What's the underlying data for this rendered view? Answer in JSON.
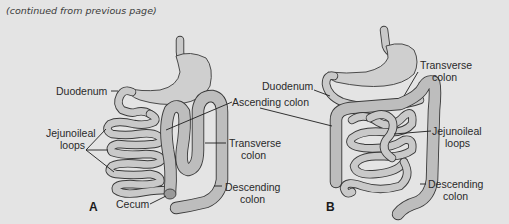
{
  "header": {
    "continuation_note": "(continued from previous page)"
  },
  "figure": {
    "panels": [
      {
        "id": "A",
        "label": "A",
        "labels": {
          "duodenum": "Duodenum",
          "jejunoileal_line1": "Jejunoileal",
          "jejunoileal_line2": "loops",
          "cecum": "Cecum",
          "ascending_colon": "Ascending colon",
          "transverse_line1": "Transverse",
          "transverse_line2": "colon",
          "descending_line1": "Descending",
          "descending_line2": "colon"
        }
      },
      {
        "id": "B",
        "label": "B",
        "labels": {
          "duodenum": "Duodenum",
          "transverse_line1": "Transverse",
          "transverse_line2": "colon",
          "jejunoileal_line1": "Jejunoileal",
          "jejunoileal_line2": "loops",
          "descending_line1": "Descending",
          "descending_line2": "colon"
        }
      }
    ]
  },
  "colors": {
    "background": "#e4e4e4",
    "organ_fill": "#cfcfcf",
    "outline": "#3a3a3a",
    "text": "#2a2a2a"
  }
}
